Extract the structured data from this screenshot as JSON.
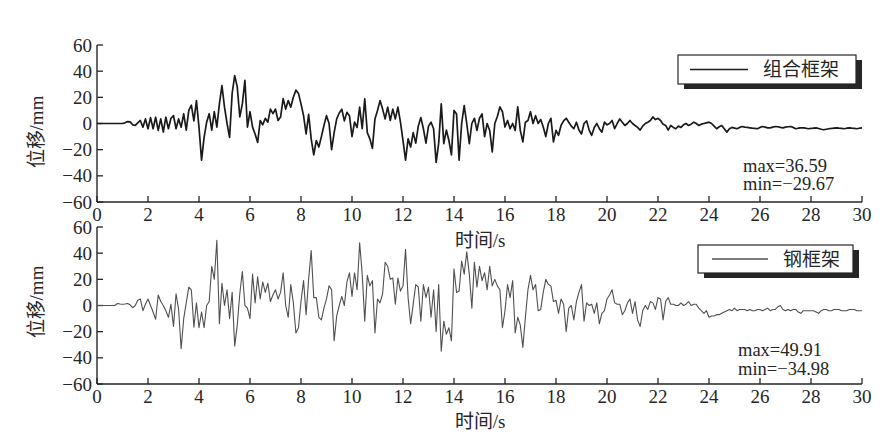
{
  "chart_data": [
    {
      "type": "line",
      "title": "",
      "xlabel": "时间/s",
      "ylabel": "位移/mm",
      "xlim": [
        0,
        30
      ],
      "ylim": [
        -60,
        60
      ],
      "grid": false,
      "xticks": [
        0,
        2,
        4,
        6,
        8,
        10,
        12,
        14,
        16,
        18,
        20,
        22,
        24,
        26,
        28,
        30
      ],
      "xtick_labels": [
        "0",
        "2",
        "4",
        "6",
        "8",
        "10",
        "12",
        "14",
        "16",
        "18",
        "20",
        "22",
        "24",
        "26",
        "28",
        "30"
      ],
      "yticks": [
        -60,
        -40,
        -20,
        0,
        20,
        40,
        60
      ],
      "ytick_labels": [
        "−60",
        "−40",
        "−20",
        "0",
        "20",
        "40",
        "60"
      ],
      "legend": {
        "label": "组合框架",
        "position": "upper right"
      },
      "annotations": [
        "max=36.59",
        "min=−29.67"
      ],
      "stats": {
        "max": 36.59,
        "min": -29.67
      },
      "series": [
        {
          "name": "组合框架",
          "color": "#1a1a1a",
          "x_start": 0,
          "x_step": 0.1,
          "values": [
            0,
            0,
            0,
            0,
            0,
            0,
            0,
            0,
            0,
            0,
            0,
            0.5,
            1.5,
            1.2,
            -1,
            -1.5,
            0.5,
            2.3,
            -2.8,
            3.5,
            -4,
            4.5,
            -4,
            4.8,
            -5.3,
            3.5,
            -6.5,
            4.8,
            -4,
            4,
            6,
            -4,
            3.5,
            -2.8,
            7.4,
            -5,
            10,
            14,
            2,
            17.5,
            -3,
            -28,
            -10.6,
            1,
            7.5,
            -5,
            9,
            -2.8,
            15,
            29,
            12.5,
            0,
            -10.6,
            23,
            36.6,
            28,
            5,
            15,
            33,
            -2.8,
            9,
            -2.8,
            -8,
            -14.5,
            2.3,
            -1,
            4,
            1,
            11,
            7.5,
            11,
            2.3,
            5,
            19,
            11,
            17.5,
            12.5,
            20,
            25.5,
            23,
            15,
            6,
            -8,
            7,
            -11.7,
            -24,
            -13,
            -18,
            -10,
            -1.5,
            6,
            0,
            -20,
            -7,
            3.5,
            8,
            11,
            2,
            8.5,
            6,
            -10,
            1,
            -3,
            12.5,
            -4,
            18.8,
            -7,
            -11.7,
            -19,
            3.5,
            10,
            17.5,
            11,
            3.5,
            12.5,
            2.3,
            11,
            3.5,
            12.5,
            1,
            -13,
            -28,
            -11.7,
            -18,
            -7,
            -15,
            -2,
            4.5,
            -4,
            -15,
            -2,
            1,
            -4,
            -29.7,
            -15,
            15,
            -15.4,
            -5,
            -13,
            -24,
            10,
            7.3,
            -28,
            0,
            13.7,
            0,
            -15.4,
            0,
            4,
            -5.3,
            4,
            7.3,
            -10,
            0,
            -5.3,
            -21.8,
            0,
            5.3,
            12.7,
            9,
            -2.7,
            2.3,
            -4,
            0,
            -5.3,
            12.7,
            -5.3,
            -14,
            1,
            2.3,
            9,
            0,
            6,
            0,
            3,
            -2.7,
            -10,
            0,
            4,
            -14,
            -5.3,
            -9,
            -1.3,
            2,
            4,
            1,
            -2,
            -4,
            1,
            -5,
            -8,
            0,
            2,
            -5,
            -9,
            -3,
            0,
            -4,
            -6.6,
            1,
            -1,
            0,
            2.3,
            -4,
            0,
            3.5,
            1,
            -1.5,
            0,
            2.3,
            0,
            -1.5,
            -3,
            -5,
            -2,
            0,
            1,
            2.3,
            5,
            3,
            4,
            2.3,
            -0.5,
            -1.5,
            -5,
            -1.5,
            -3,
            -4,
            -2,
            -3,
            -1,
            0,
            -1.5,
            -0.5,
            1,
            0,
            -1.5,
            -0.5,
            0,
            0.5,
            1,
            0,
            -2,
            -4,
            -2.5,
            -1.5,
            -4,
            -6.6,
            -4,
            -3,
            -3.5,
            -4,
            -3,
            -2.3,
            -2.8,
            -3,
            -3.3,
            -3.6,
            -3.8,
            -4,
            -3,
            -2.3,
            -2.8,
            -3.3,
            -3.3,
            -2.8,
            -2.3,
            -2.5,
            -3,
            -3.3,
            -2.8,
            -2.5,
            -2.3,
            -3,
            -4,
            -3.6,
            -3.3,
            -3.3,
            -3.6,
            -4,
            -3.8,
            -3.5,
            -3.3,
            -3.8,
            -4.4,
            -4.8,
            -4.4,
            -4,
            -3.8,
            -3.5,
            -3.3,
            -3.6,
            -3.8,
            -4,
            -3.6,
            -3.3,
            -3.6,
            -3.8,
            -4,
            -3.6,
            -3.3
          ]
        }
      ]
    },
    {
      "type": "line",
      "title": "",
      "xlabel": "时间/s",
      "ylabel": "位移/mm",
      "xlim": [
        0,
        30
      ],
      "ylim": [
        -60,
        60
      ],
      "grid": false,
      "xticks": [
        0,
        2,
        4,
        6,
        8,
        10,
        12,
        14,
        16,
        18,
        20,
        22,
        24,
        26,
        28,
        30
      ],
      "xtick_labels": [
        "0",
        "2",
        "4",
        "6",
        "8",
        "10",
        "12",
        "14",
        "16",
        "18",
        "20",
        "22",
        "24",
        "26",
        "28",
        "30"
      ],
      "yticks": [
        -60,
        -40,
        -20,
        0,
        20,
        40,
        60
      ],
      "ytick_labels": [
        "−60",
        "−40",
        "−20",
        "0",
        "20",
        "40",
        "60"
      ],
      "legend": {
        "label": "钢框架",
        "position": "upper right"
      },
      "annotations": [
        "max=49.91",
        "min=−34.98"
      ],
      "stats": {
        "max": 49.91,
        "min": -34.98
      },
      "series": [
        {
          "name": "钢框架",
          "color": "#505050",
          "x_start": 0,
          "x_step": 0.1,
          "values": [
            0,
            0,
            0,
            0,
            0,
            0,
            0,
            0,
            1.5,
            1.2,
            1,
            1.2,
            1.5,
            0.5,
            -1.7,
            0,
            4,
            5,
            -4,
            1,
            5,
            0,
            -5,
            -10.5,
            8,
            3,
            0,
            -4,
            -9,
            1,
            -16,
            9,
            -3,
            -33,
            -10,
            2,
            14,
            12,
            -16.5,
            2,
            -17,
            -5,
            -17,
            0,
            3,
            30,
            20,
            49.9,
            -14,
            17,
            0,
            12,
            -10,
            10,
            -31,
            -15,
            9,
            26,
            0,
            -2,
            -10,
            24,
            2,
            22,
            5,
            18,
            10,
            17,
            3,
            8,
            12,
            5,
            10,
            25,
            0,
            -9,
            16,
            2,
            -21,
            -17,
            3,
            19,
            -7,
            20,
            42,
            6,
            6,
            -9,
            -11,
            -2,
            5,
            15,
            12,
            -27,
            -8,
            0,
            7,
            0,
            18,
            25,
            7,
            25,
            12,
            48,
            24,
            -12,
            23,
            15,
            19,
            -21,
            5,
            2,
            9,
            33,
            30,
            20,
            21,
            1,
            21,
            11,
            15,
            43,
            6,
            -14,
            1,
            16,
            14,
            -12,
            16,
            6,
            14,
            -9,
            12,
            -20,
            16,
            -35,
            -12,
            -22,
            -17,
            -27,
            28,
            10,
            11,
            34,
            24,
            41,
            24,
            -2,
            33,
            14,
            30,
            19,
            25,
            12,
            30,
            15,
            20,
            15,
            12,
            -17,
            -4,
            16,
            6,
            19,
            -21,
            -9,
            -15,
            -32,
            -9,
            12,
            23,
            12,
            16,
            -4,
            -3,
            10,
            20,
            16,
            15,
            3,
            4,
            -6,
            5,
            1,
            -20,
            -2,
            0,
            -11,
            3,
            10,
            16,
            -12,
            2,
            0,
            1,
            -6,
            2,
            -14,
            -6,
            -4,
            5,
            8,
            12,
            2,
            1,
            1,
            -7,
            -4,
            2,
            5,
            -6,
            3,
            -11,
            -16,
            -4,
            0,
            -3,
            3,
            2,
            -3,
            6,
            5,
            -11,
            3,
            6,
            1,
            1,
            0,
            0,
            2,
            0,
            1,
            3,
            0,
            1,
            1,
            -2,
            -4,
            -6,
            -4,
            -9,
            -8,
            -8,
            -7,
            -7,
            -6,
            -5,
            -4,
            -3,
            -4,
            -2,
            -4,
            -3,
            -3,
            -3,
            -4,
            -3,
            -4,
            -4,
            -3,
            -3,
            -4,
            -3,
            -2,
            -4,
            -3,
            -3,
            -1,
            0,
            -3,
            -4,
            -3,
            -4,
            -3,
            -3,
            -5,
            -6,
            -4,
            -4,
            -4,
            -4,
            -4,
            -5,
            -6,
            -4,
            -3,
            -3,
            -4,
            -4,
            -3,
            -3,
            -3,
            -4,
            -4,
            -4,
            -3,
            -3,
            -3,
            -4,
            -4,
            -4
          ]
        }
      ]
    }
  ]
}
